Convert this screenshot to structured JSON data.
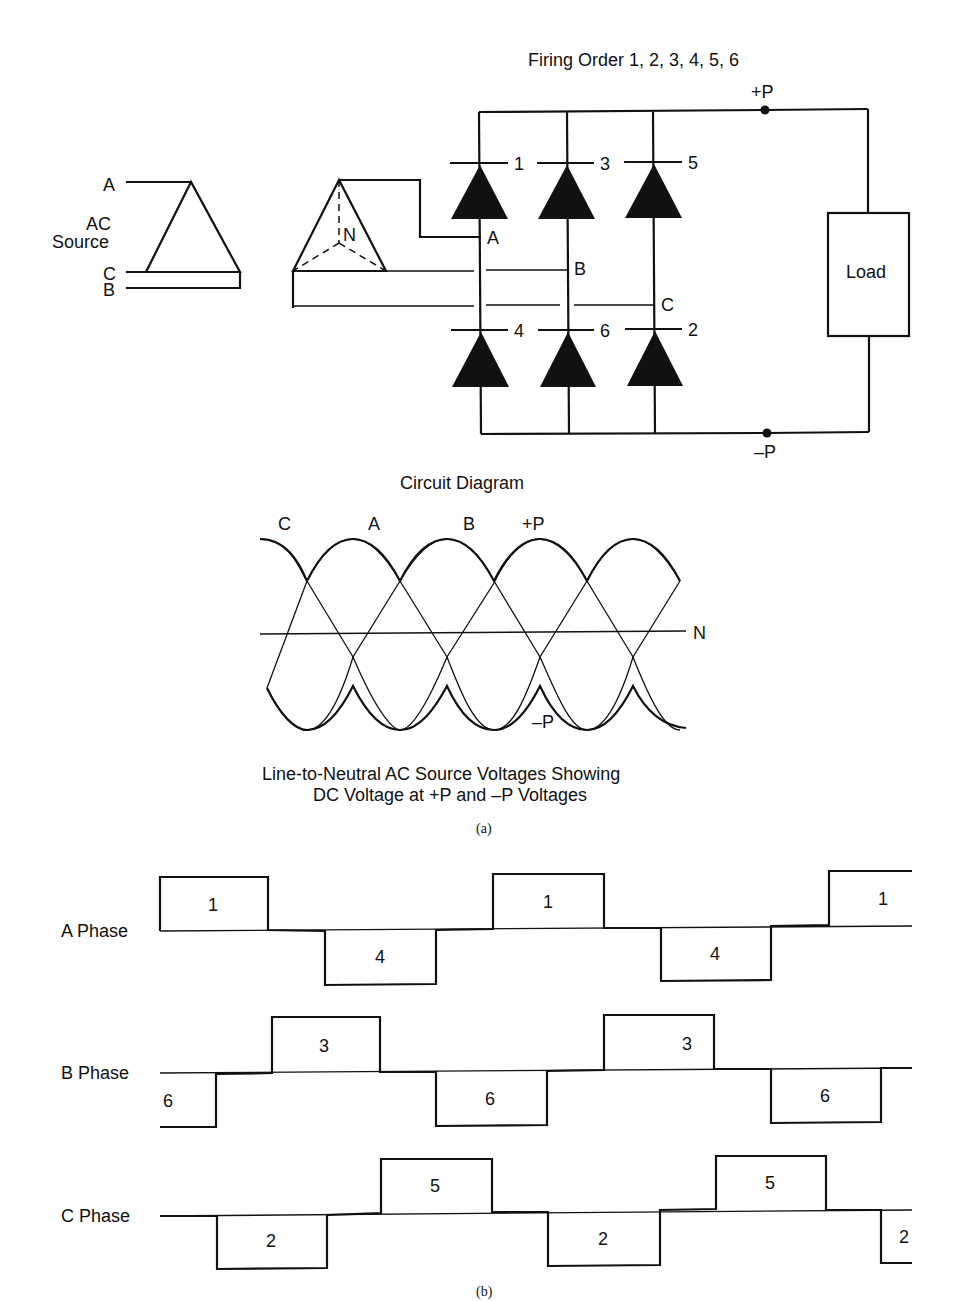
{
  "circuit": {
    "title": "Firing Order 1, 2, 3, 4, 5, 6",
    "caption": "Circuit Diagram",
    "source_label_line1": "AC",
    "source_label_line2": "Source",
    "phase_labels": [
      "A",
      "B",
      "C"
    ],
    "neutral_label": "N",
    "bus_positive": "+P",
    "bus_negative": "–P",
    "load_label": "Load",
    "upper_diodes": [
      "1",
      "3",
      "5"
    ],
    "lower_diodes": [
      "4",
      "6",
      "2"
    ],
    "node_labels": [
      "A",
      "B",
      "C"
    ]
  },
  "waveform": {
    "wave_labels": [
      "C",
      "A",
      "B",
      "+P"
    ],
    "neutral_label": "N",
    "negative_label": "–P",
    "caption_line1": "Line-to-Neutral AC Source Voltages Showing",
    "caption_line2": "DC Voltage at +P and –P Voltages",
    "part_label": "(a)"
  },
  "conduction": {
    "part_label": "(b)",
    "phases": [
      {
        "name": "A Phase",
        "pulses": [
          {
            "label": "1",
            "pol": "+"
          },
          {
            "label": "4",
            "pol": "-"
          },
          {
            "label": "1",
            "pol": "+"
          },
          {
            "label": "4",
            "pol": "-"
          },
          {
            "label": "1",
            "pol": "+"
          }
        ]
      },
      {
        "name": "B Phase",
        "pulses": [
          {
            "label": "6",
            "pol": "-"
          },
          {
            "label": "3",
            "pol": "+"
          },
          {
            "label": "6",
            "pol": "-"
          },
          {
            "label": "3",
            "pol": "+"
          },
          {
            "label": "6",
            "pol": "-"
          }
        ]
      },
      {
        "name": "C Phase",
        "pulses": [
          {
            "label": "2",
            "pol": "-"
          },
          {
            "label": "5",
            "pol": "+"
          },
          {
            "label": "2",
            "pol": "-"
          },
          {
            "label": "5",
            "pol": "+"
          },
          {
            "label": "2",
            "pol": "-"
          }
        ]
      }
    ]
  }
}
